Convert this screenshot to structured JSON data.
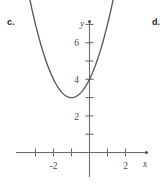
{
  "figure": {
    "choice_labels": [
      {
        "id": "c",
        "text": "c."
      },
      {
        "id": "d",
        "text": "d."
      }
    ],
    "axis": {
      "x_name": "x",
      "y_name": "y",
      "x_tick_labels": [
        "-2",
        "2"
      ],
      "y_tick_labels": [
        "2",
        "4",
        "6"
      ],
      "axis_color": "#6b6b6b",
      "curve_color": "#58595b"
    }
  },
  "chart_data": {
    "type": "line",
    "title": "",
    "xlabel": "x",
    "ylabel": "y",
    "xlim": [
      -4,
      3
    ],
    "ylim": [
      -0.6,
      8
    ],
    "xticks": [
      -3,
      -2,
      -1,
      0,
      1,
      2
    ],
    "yticks": [
      1,
      2,
      3,
      4,
      5,
      6,
      7
    ],
    "xtick_labels": {
      "-2": "-2",
      "2": "2"
    },
    "ytick_labels": {
      "2": "2",
      "4": "4",
      "6": "6"
    },
    "grid": false,
    "legend": null,
    "series": [
      {
        "name": "parabola",
        "equation": "y = (x + 1)^2 + 3",
        "vertex": [
          -1,
          3
        ],
        "y_intercept": [
          0,
          4
        ],
        "x": [
          -3.35,
          -3.0,
          -2.5,
          -2.0,
          -1.5,
          -1.0,
          -0.5,
          0.0,
          0.5,
          1.0,
          1.35
        ],
        "values": [
          8.52,
          7.0,
          5.25,
          4.0,
          3.25,
          3.0,
          3.25,
          4.0,
          5.25,
          7.0,
          8.52
        ]
      }
    ]
  }
}
